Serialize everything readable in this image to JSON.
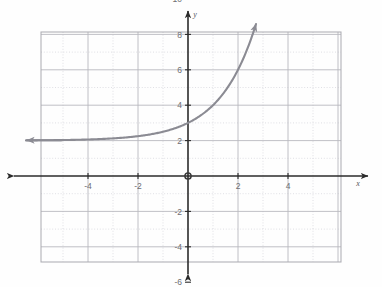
{
  "chart_data": {
    "type": "line",
    "title": "",
    "subtitle": "",
    "xlabel": "x",
    "ylabel": "y",
    "xlim": [
      -5.9,
      6.1
    ],
    "ylim": [
      -6.9,
      10.9
    ],
    "grid": true,
    "minor_grid": true,
    "legend": null,
    "legend_position": "none",
    "x_ticks": [
      -4,
      -2,
      2,
      4
    ],
    "x_tick_labels": [
      "-4",
      "-2",
      "2",
      "4"
    ],
    "y_ticks": [
      10,
      8,
      6,
      4,
      2,
      -2,
      -4,
      -6
    ],
    "y_tick_labels": [
      "10",
      "8",
      "6",
      "4",
      "2",
      "-2",
      "-4",
      "-6"
    ],
    "x_major_step": 2,
    "y_major_step": 2,
    "x_minor_step": 1,
    "y_minor_step": 1,
    "annotations": [
      {
        "name": "origin-marker",
        "x": 0,
        "y": 0,
        "label": ""
      }
    ],
    "series": [
      {
        "name": "exponential-curve",
        "equation": "y = 2^x + 2",
        "asymptote": 2,
        "y_intercept": 3,
        "color": "#8b8b93",
        "arrow_start": true,
        "arrow_end": true,
        "x": [
          -5.9,
          -5.5,
          -5.0,
          -4.5,
          -4.0,
          -3.5,
          -3.0,
          -2.5,
          -2.0,
          -1.5,
          -1.0,
          -0.5,
          0.0,
          0.5,
          1.0,
          1.5,
          2.0,
          2.3,
          2.5,
          2.7
        ],
        "values": [
          2.017,
          2.022,
          2.031,
          2.044,
          2.063,
          2.088,
          2.125,
          2.177,
          2.25,
          2.354,
          2.5,
          2.707,
          3.0,
          3.414,
          4.0,
          4.828,
          6.0,
          6.92,
          7.657,
          8.498
        ]
      }
    ],
    "axes_style": {
      "axis_color": "#2b2b2b",
      "major_grid_color": "#b9b9c0",
      "minor_grid_color": "#d8d8de",
      "plot_border_color": "#a9a9b0",
      "background": "#fefefe"
    }
  },
  "labels": {
    "x_axis_name": "x",
    "y_axis_name": "y"
  }
}
